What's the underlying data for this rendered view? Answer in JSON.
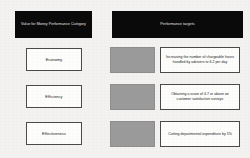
{
  "diagram": {
    "background_color": "#f3f2f0",
    "header_fill": "#0a0a0a",
    "header_text_color": "#e9e9e9",
    "box_fill": "#fdfdfc",
    "box_border_color": "#4a4a4a",
    "placeholder_fill": "#9b9b9b"
  },
  "headers": {
    "left": "Value for Money Performance Category",
    "right": "Performance targets"
  },
  "rows": [
    {
      "category": "Economy",
      "target": "Increasing the number of chargeable hours handled by advisers to 6.2 per day"
    },
    {
      "category": "Efficiency",
      "target": "Obtaining a score of 4.7 or above on customer satisfaction surveys"
    },
    {
      "category": "Effectiveness",
      "target": "Cutting departmental expenditure by 5%"
    }
  ]
}
